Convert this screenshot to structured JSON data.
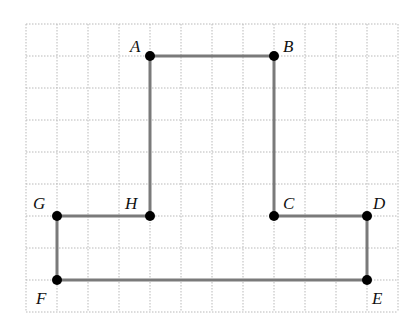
{
  "diagram": {
    "type": "polygon-on-grid",
    "grid": {
      "origin_px": [
        26,
        24
      ],
      "cell_w": 31,
      "cell_h": 32,
      "cols": 12,
      "rows": 9,
      "line_color": "#b9b9b9"
    },
    "edge_color": "#7a7a7a",
    "vertex_color": "#000000",
    "vertices": [
      {
        "name": "A",
        "gx": 4,
        "gy": 1,
        "label_dx": -20,
        "label_dy": -4
      },
      {
        "name": "B",
        "gx": 8,
        "gy": 1,
        "label_dx": 9,
        "label_dy": -4
      },
      {
        "name": "C",
        "gx": 8,
        "gy": 6,
        "label_dx": 9,
        "label_dy": -7
      },
      {
        "name": "D",
        "gx": 11,
        "gy": 6,
        "label_dx": 6,
        "label_dy": -7
      },
      {
        "name": "E",
        "gx": 11,
        "gy": 8,
        "label_dx": 5,
        "label_dy": 24
      },
      {
        "name": "F",
        "gx": 1,
        "gy": 8,
        "label_dx": -21,
        "label_dy": 24
      },
      {
        "name": "G",
        "gx": 1,
        "gy": 6,
        "label_dx": -24,
        "label_dy": -7
      },
      {
        "name": "H",
        "gx": 4,
        "gy": 6,
        "label_dx": -25,
        "label_dy": -7
      }
    ],
    "edges": [
      [
        "A",
        "B"
      ],
      [
        "B",
        "C"
      ],
      [
        "C",
        "D"
      ],
      [
        "D",
        "E"
      ],
      [
        "E",
        "F"
      ],
      [
        "F",
        "G"
      ],
      [
        "G",
        "H"
      ],
      [
        "H",
        "A"
      ]
    ]
  }
}
